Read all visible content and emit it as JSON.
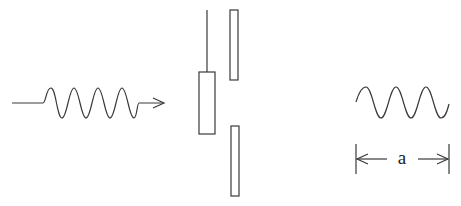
{
  "diagram": {
    "type": "wave-slit-illustration",
    "colors": {
      "line": "#3a3a3a",
      "background": "#ffffff",
      "text": "#222222"
    },
    "incoming_wave": {
      "periods": 3,
      "direction": "right",
      "has_arrowhead": true
    },
    "slit_assembly": {
      "left_plate": {
        "description": "movable plate on rod"
      },
      "right_plates": [
        "upper-plate",
        "lower-plate"
      ]
    },
    "reference_wave": {
      "periods": 3
    },
    "dimension": {
      "label": "a"
    }
  }
}
